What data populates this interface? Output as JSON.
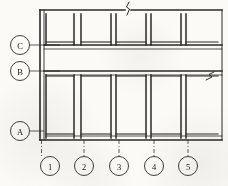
{
  "drawing": {
    "title": "Building Column Grid Plan",
    "type": "architectural-floor-plan",
    "ink_color": "#2b2a28",
    "paper_color": "#fbfaf7",
    "line_weight_heavy": 1.6,
    "line_weight_light": 0.8
  },
  "grid": {
    "horizontal_axes": [
      {
        "label": "C",
        "cx": 20,
        "cy": 45,
        "r": 9.5,
        "leader_to_x": 60,
        "leader_y": 45
      },
      {
        "label": "B",
        "cx": 20,
        "cy": 71,
        "r": 9.5,
        "leader_to_x": 60,
        "leader_y": 71
      },
      {
        "label": "A",
        "cx": 20,
        "cy": 131,
        "r": 9.5,
        "leader_to_x": 45,
        "leader_y": 131
      }
    ],
    "vertical_axes": [
      {
        "label": "1",
        "cx": 50,
        "cy": 166,
        "r": 9.5,
        "leader_from_y": 140,
        "leader_to_y": 156
      },
      {
        "label": "2",
        "cx": 84,
        "cy": 166,
        "r": 9.5,
        "leader_from_y": 140,
        "leader_to_y": 156
      },
      {
        "label": "3",
        "cx": 119,
        "cy": 166,
        "r": 9.5,
        "leader_from_y": 140,
        "leader_to_y": 156
      },
      {
        "label": "4",
        "cx": 154,
        "cy": 166,
        "r": 9.5,
        "leader_from_y": 140,
        "leader_to_y": 156
      },
      {
        "label": "5",
        "cx": 188,
        "cy": 166,
        "r": 9.5,
        "leader_from_y": 140,
        "leader_to_y": 156
      }
    ]
  },
  "structure": {
    "plan_left": 40,
    "plan_right": 222,
    "plan_top": 10,
    "plan_bottom": 140,
    "corridor_top_y": 45,
    "corridor_bottom_y": 71,
    "upper_rooms": [
      {
        "x": 46,
        "y": 14,
        "w": 28,
        "h": 31
      },
      {
        "x": 81,
        "y": 14,
        "w": 30,
        "h": 31
      },
      {
        "x": 116,
        "y": 14,
        "w": 30,
        "h": 31
      },
      {
        "x": 151,
        "y": 14,
        "w": 30,
        "h": 31
      },
      {
        "x": 186,
        "y": 14,
        "w": 32,
        "h": 31
      }
    ],
    "lower_rooms": [
      {
        "x": 46,
        "y": 76,
        "w": 28,
        "h": 60
      },
      {
        "x": 81,
        "y": 76,
        "w": 30,
        "h": 60
      },
      {
        "x": 116,
        "y": 76,
        "w": 30,
        "h": 60
      },
      {
        "x": 151,
        "y": 76,
        "w": 30,
        "h": 60
      },
      {
        "x": 186,
        "y": 76,
        "w": 32,
        "h": 60
      }
    ],
    "break_marks": [
      {
        "name": "top-break-symbol",
        "x": 128,
        "y": 11
      },
      {
        "name": "right-break-symbol",
        "x": 211,
        "y": 78
      }
    ]
  }
}
